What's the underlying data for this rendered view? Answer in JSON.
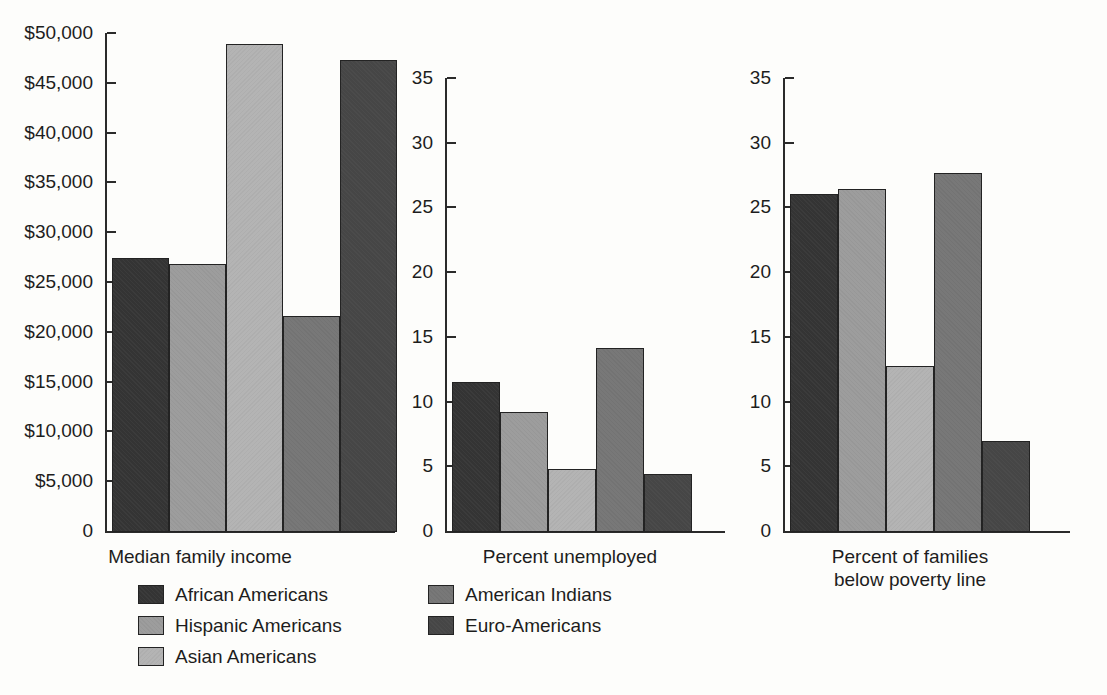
{
  "figure": {
    "background_color": "#fdfdfb",
    "axis_color": "#2a2a2a",
    "text_color": "#1d1d1d"
  },
  "series": [
    {
      "name": "African Americans",
      "label": "African Americans",
      "color": "#343434",
      "texture": "t0"
    },
    {
      "name": "Hispanic Americans",
      "label": "Hispanic Americans",
      "color": "#9d9d9d",
      "texture": "t1"
    },
    {
      "name": "Asian Americans",
      "label": "Asian Americans",
      "color": "#b4b4b4",
      "texture": "t2"
    },
    {
      "name": "American Indians",
      "label": "American Indians",
      "color": "#787878",
      "texture": "t3"
    },
    {
      "name": "Euro-Americans",
      "label": "Euro-Americans",
      "color": "#464646",
      "texture": "t4"
    }
  ],
  "legend": {
    "position": "bottom",
    "columns": 2,
    "entries": [
      {
        "label": "African Americans",
        "color": "#343434",
        "texture": "t0",
        "col": 0,
        "row": 0
      },
      {
        "label": "Hispanic Americans",
        "color": "#9d9d9d",
        "texture": "t1",
        "col": 0,
        "row": 1
      },
      {
        "label": "Asian Americans",
        "color": "#b4b4b4",
        "texture": "t2",
        "col": 0,
        "row": 2
      },
      {
        "label": "American Indians",
        "color": "#787878",
        "texture": "t3",
        "col": 1,
        "row": 0
      },
      {
        "label": "Euro-Americans",
        "color": "#464646",
        "texture": "t4",
        "col": 1,
        "row": 1
      }
    ]
  },
  "chart_data": [
    {
      "type": "bar",
      "title": "",
      "xlabel": "Median family income",
      "ylabel": "",
      "categories": [
        "African Americans",
        "Hispanic Americans",
        "Asian Americans",
        "American Indians",
        "Euro-Americans"
      ],
      "values": [
        27500,
        26900,
        49000,
        21700,
        47400
      ],
      "ylim": [
        0,
        50000
      ],
      "yticks": [
        0,
        5000,
        10000,
        15000,
        20000,
        25000,
        30000,
        35000,
        40000,
        45000,
        50000
      ],
      "ytick_labels": [
        "0",
        "$5,000",
        "$10,000",
        "$15,000",
        "$20,000",
        "$25,000",
        "$30,000",
        "$35,000",
        "$40,000",
        "$45,000",
        "$50,000"
      ],
      "grid": false,
      "legend": true
    },
    {
      "type": "bar",
      "title": "",
      "xlabel": "Percent unemployed",
      "ylabel": "",
      "categories": [
        "African Americans",
        "Hispanic Americans",
        "Asian Americans",
        "American Indians",
        "Euro-Americans"
      ],
      "values": [
        11.6,
        9.3,
        4.9,
        14.2,
        4.5
      ],
      "ylim": [
        0,
        35
      ],
      "yticks": [
        0,
        5,
        10,
        15,
        20,
        25,
        30,
        35
      ],
      "ytick_labels": [
        "0",
        "5",
        "10",
        "15",
        "20",
        "25",
        "30",
        "35"
      ],
      "grid": false,
      "legend": false
    },
    {
      "type": "bar",
      "title": "",
      "xlabel": "Percent of families\nbelow poverty line",
      "xlabel_line1": "Percent of families",
      "xlabel_line2": "below poverty line",
      "categories": [
        "African Americans",
        "Hispanic Americans",
        "Asian Americans",
        "American Indians",
        "Euro-Americans"
      ],
      "values": [
        26.1,
        26.5,
        12.8,
        27.7,
        7.0
      ],
      "ylim": [
        0,
        35
      ],
      "yticks": [
        0,
        5,
        10,
        15,
        20,
        25,
        30,
        35
      ],
      "ytick_labels": [
        "0",
        "5",
        "10",
        "15",
        "20",
        "25",
        "30",
        "35"
      ],
      "grid": false,
      "legend": false
    }
  ]
}
